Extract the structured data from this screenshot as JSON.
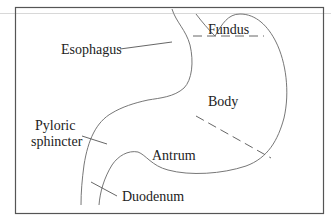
{
  "diagram": {
    "labels": {
      "esophagus": "Esophagus",
      "fundus": "Fundus",
      "body": "Body",
      "pyloric_line1": "Pyloric",
      "pyloric_line2": "sphincter",
      "antrum": "Antrum",
      "duodenum": "Duodenum"
    },
    "colors": {
      "outline": "#777777",
      "text": "#222222",
      "frame": "#555555",
      "background": "#ffffff"
    }
  }
}
